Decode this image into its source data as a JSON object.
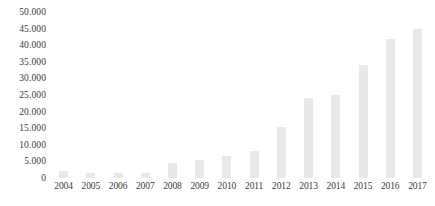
{
  "chart_data": {
    "type": "bar",
    "title": "",
    "subtitle": "",
    "xlabel": "",
    "ylabel": "",
    "categories": [
      "2004",
      "2005",
      "2006",
      "2007",
      "2008",
      "2009",
      "2010",
      "2011",
      "2012",
      "2013",
      "2014",
      "2015",
      "2016",
      "2017"
    ],
    "values": [
      2200,
      1400,
      1500,
      1400,
      4500,
      5300,
      6500,
      8200,
      15500,
      24000,
      25000,
      34000,
      42000,
      45000
    ],
    "ytick_labels": [
      "50.000",
      "45.000",
      "40.000",
      "35.000",
      "30.000",
      "25.000",
      "20.000",
      "15.000",
      "10.000",
      "5.000",
      "0"
    ],
    "ytick_values": [
      50000,
      45000,
      40000,
      35000,
      30000,
      25000,
      20000,
      15000,
      10000,
      5000,
      0
    ],
    "ylim": [
      0,
      50000
    ],
    "grid": false,
    "legend": null,
    "bar_color": "#e9e9e9",
    "text_color": "#3a3a3a",
    "background_color": "#ffffff"
  }
}
